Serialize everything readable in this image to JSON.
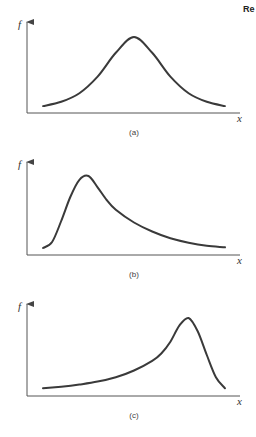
{
  "corner_text": "Re",
  "chart_data": [
    {
      "type": "line",
      "caption": "(a)",
      "ylabel": "f",
      "xlabel": "x",
      "shape": "symmetric",
      "description": "Symmetric bell-shaped distribution",
      "x": [
        0.0,
        0.1,
        0.2,
        0.3,
        0.4,
        0.5,
        0.6,
        0.7,
        0.8,
        0.9,
        1.0
      ],
      "y": [
        0.04,
        0.1,
        0.22,
        0.45,
        0.78,
        1.0,
        0.78,
        0.45,
        0.22,
        0.1,
        0.04
      ]
    },
    {
      "type": "line",
      "caption": "(b)",
      "ylabel": "f",
      "xlabel": "x",
      "shape": "right-skewed",
      "description": "Positively skewed distribution with long right tail",
      "x": [
        0.0,
        0.05,
        0.1,
        0.15,
        0.2,
        0.25,
        0.3,
        0.35,
        0.4,
        0.5,
        0.6,
        0.7,
        0.8,
        0.9,
        1.0
      ],
      "y": [
        0.04,
        0.12,
        0.4,
        0.72,
        0.95,
        1.0,
        0.85,
        0.68,
        0.55,
        0.38,
        0.26,
        0.17,
        0.11,
        0.07,
        0.05
      ]
    },
    {
      "type": "line",
      "caption": "(c)",
      "ylabel": "f",
      "xlabel": "x",
      "shape": "left-skewed",
      "description": "Negatively skewed distribution with long left tail",
      "x": [
        0.0,
        0.1,
        0.2,
        0.3,
        0.4,
        0.5,
        0.6,
        0.65,
        0.7,
        0.75,
        0.8,
        0.85,
        0.9,
        0.95,
        1.0
      ],
      "y": [
        0.05,
        0.07,
        0.1,
        0.14,
        0.2,
        0.29,
        0.42,
        0.52,
        0.68,
        0.9,
        1.0,
        0.82,
        0.5,
        0.2,
        0.05
      ]
    }
  ]
}
